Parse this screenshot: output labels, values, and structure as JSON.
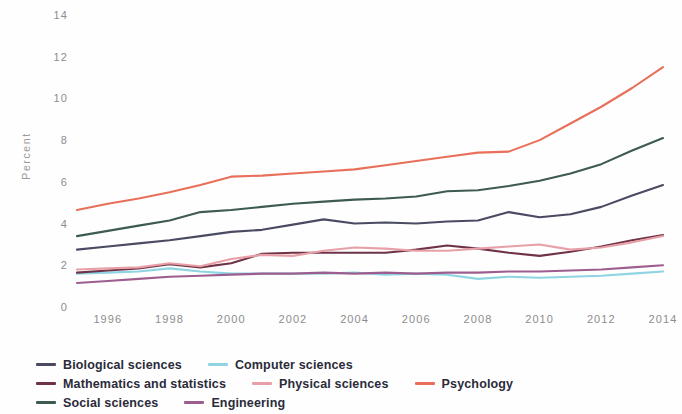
{
  "chart_data": {
    "type": "line",
    "title": "",
    "subtitle": "",
    "xlabel": "",
    "ylabel": "Percent",
    "grid": false,
    "legend_position": "bottom-left",
    "xlim": [
      1995,
      2014
    ],
    "ylim": [
      0,
      14
    ],
    "x": [
      1995,
      1996,
      1997,
      1998,
      1999,
      2000,
      2001,
      2002,
      2003,
      2004,
      2005,
      2006,
      2007,
      2008,
      2009,
      2010,
      2011,
      2012,
      2013,
      2014
    ],
    "x_tick_labels": [
      "1996",
      "1998",
      "2000",
      "2002",
      "2004",
      "2006",
      "2008",
      "2010",
      "2012",
      "2014"
    ],
    "x_ticks": [
      1996,
      1998,
      2000,
      2002,
      2004,
      2006,
      2008,
      2010,
      2012,
      2014
    ],
    "y_ticks": [
      0,
      2,
      4,
      6,
      8,
      10,
      12,
      14
    ],
    "y_tick_labels": [
      "0",
      "2",
      "4",
      "6",
      "8",
      "10",
      "12",
      "14"
    ],
    "series": [
      {
        "name": "Biological sciences",
        "color": "#4a4a63",
        "values": [
          2.75,
          2.9,
          3.05,
          3.2,
          3.4,
          3.6,
          3.7,
          3.95,
          4.2,
          4.0,
          4.05,
          4.0,
          4.1,
          4.15,
          4.55,
          4.3,
          4.45,
          4.8,
          5.35,
          5.85
        ]
      },
      {
        "name": "Computer sciences",
        "color": "#8ed4e2",
        "values": [
          1.6,
          1.65,
          1.7,
          1.85,
          1.7,
          1.6,
          1.6,
          1.6,
          1.6,
          1.65,
          1.55,
          1.6,
          1.55,
          1.35,
          1.45,
          1.4,
          1.45,
          1.5,
          1.6,
          1.7
        ]
      },
      {
        "name": "Mathematics and statistics",
        "color": "#6e3347",
        "values": [
          1.65,
          1.75,
          1.85,
          2.05,
          1.9,
          2.1,
          2.55,
          2.6,
          2.6,
          2.6,
          2.6,
          2.75,
          2.95,
          2.8,
          2.6,
          2.45,
          2.65,
          2.9,
          3.2,
          3.45
        ]
      },
      {
        "name": "Physical sciences",
        "color": "#e8a0a8",
        "values": [
          1.8,
          1.85,
          1.9,
          2.1,
          1.95,
          2.3,
          2.5,
          2.45,
          2.7,
          2.85,
          2.8,
          2.7,
          2.7,
          2.8,
          2.9,
          3.0,
          2.75,
          2.85,
          3.1,
          3.4
        ]
      },
      {
        "name": "Psychology",
        "color": "#e8705a",
        "values": [
          4.65,
          4.95,
          5.2,
          5.5,
          5.85,
          6.25,
          6.3,
          6.4,
          6.5,
          6.6,
          6.8,
          7.0,
          7.2,
          7.4,
          7.45,
          8.0,
          8.8,
          9.6,
          10.5,
          11.5
        ]
      },
      {
        "name": "Social sciences",
        "color": "#3d5b4e",
        "values": [
          3.4,
          3.65,
          3.9,
          4.15,
          4.55,
          4.65,
          4.8,
          4.95,
          5.05,
          5.15,
          5.2,
          5.3,
          5.55,
          5.6,
          5.8,
          6.05,
          6.4,
          6.85,
          7.5,
          8.1
        ]
      },
      {
        "name": "Engineering",
        "color": "#9d5d8e",
        "values": [
          1.15,
          1.25,
          1.35,
          1.45,
          1.5,
          1.55,
          1.6,
          1.6,
          1.65,
          1.6,
          1.65,
          1.6,
          1.65,
          1.65,
          1.7,
          1.7,
          1.75,
          1.8,
          1.9,
          2.0
        ]
      }
    ]
  },
  "axes": {
    "y_title": "Percent"
  },
  "legend": {
    "rows": [
      [
        {
          "label": "Biological sciences",
          "color": "#4a4a63"
        },
        {
          "label": "Computer sciences",
          "color": "#8ed4e2"
        }
      ],
      [
        {
          "label": "Mathematics and statistics",
          "color": "#6e3347"
        },
        {
          "label": "Physical sciences",
          "color": "#e8a0a8"
        },
        {
          "label": "Psychology",
          "color": "#e8705a"
        }
      ],
      [
        {
          "label": "Social sciences",
          "color": "#3d5b4e"
        },
        {
          "label": "Engineering",
          "color": "#9d5d8e"
        }
      ]
    ]
  }
}
